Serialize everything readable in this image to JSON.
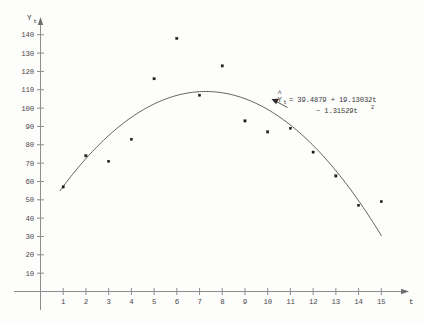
{
  "chart_data": {
    "type": "scatter",
    "title": "",
    "subtitle": "",
    "xlabel": "t",
    "ylabel": "Yt",
    "x": [
      1,
      2,
      3,
      4,
      5,
      6,
      7,
      8,
      9,
      10,
      11,
      12,
      13,
      14,
      15
    ],
    "values": [
      57,
      74,
      71,
      83,
      116,
      138,
      107,
      123,
      93,
      87,
      89,
      76,
      63,
      47,
      49
    ],
    "series": [
      {
        "name": "Observed Yt",
        "values": [
          57,
          74,
          71,
          83,
          116,
          138,
          107,
          123,
          93,
          87,
          89,
          76,
          63,
          47,
          49
        ]
      },
      {
        "name": "Fitted quadratic trend",
        "values": [
          57.29,
          72.46,
          85.01,
          94.94,
          102.24,
          106.91,
          108.96,
          108.39,
          105.19,
          99.37,
          90.92,
          79.84,
          66.14,
          49.82,
          30.86
        ]
      }
    ],
    "xlim": [
      0,
      15.8
    ],
    "ylim": [
      0,
      148
    ],
    "xticks": [
      1,
      2,
      3,
      4,
      5,
      6,
      7,
      8,
      9,
      10,
      11,
      12,
      13,
      14,
      15
    ],
    "yticks": [
      10,
      20,
      30,
      40,
      50,
      60,
      70,
      80,
      90,
      100,
      110,
      120,
      130,
      140
    ],
    "grid": false,
    "legend": "none",
    "fit_model": {
      "intercept": 39.4879,
      "linear_coefficient": 19.13032,
      "quadratic_coefficient": -1.31529
    }
  },
  "annotation": {
    "response_symbol": "Y",
    "response_subscript": "t",
    "hat_mark": "^",
    "equals": "=",
    "line1": "= 39.4879 + 19.13032t",
    "line2": "− 1.31529t",
    "line2_exponent": "2",
    "full_text": "Ŷt = 39.4879 + 19.13032t − 1.31529t²"
  },
  "axes": {
    "y_label_main": "Y",
    "y_label_sub": "t",
    "x_label": "t",
    "y_tick_labels": [
      "140",
      "130",
      "120",
      "110",
      "100",
      "90",
      "80",
      "70",
      "60",
      "50",
      "40",
      "30",
      "20",
      "10"
    ],
    "x_tick_labels": [
      "1",
      "2",
      "3",
      "4",
      "5",
      "6",
      "7",
      "8",
      "9",
      "10",
      "11",
      "12",
      "13",
      "14",
      "15"
    ]
  },
  "style": {
    "axis_color": "#8d8d8d",
    "curve_color": "#4d4d4d",
    "point_color": "#1c1c1c",
    "text_color": "#3a3a3a",
    "background": "#fdfdfc"
  }
}
